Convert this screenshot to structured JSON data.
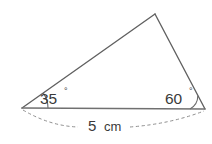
{
  "figure": {
    "kind": "triangle-geometry-diagram",
    "background_color": "#ffffff",
    "line_color": "#606060",
    "dash_color": "#8f8f8f",
    "text_color": "#3a3a3a",
    "vertices": {
      "left": {
        "x": 22,
        "y": 108
      },
      "right": {
        "x": 205,
        "y": 109
      },
      "apex": {
        "x": 155,
        "y": 14
      }
    },
    "angles": {
      "left": {
        "value": "35",
        "degree_symbol": "°",
        "label_x": 40,
        "label_y": 104,
        "deg_x": 64,
        "deg_y": 94,
        "arc_radius": 26
      },
      "right": {
        "value": "60",
        "degree_symbol": "°",
        "label_x": 165,
        "label_y": 104,
        "deg_x": 189,
        "deg_y": 94,
        "arc_radius": 15
      }
    },
    "dimension": {
      "value": "5",
      "unit": "cm",
      "label_x": 88,
      "label_y": 131,
      "unit_x": 104,
      "unit_y": 131,
      "arc_left_path": "M 23 110 Q 50 126 78 127",
      "arc_right_path": "M 130 127 Q 170 124 204 111"
    },
    "paths": {
      "left_to_apex": "M 22 108 L 155 14",
      "apex_to_right": "M 155 14 L 205 109",
      "base": "M 22 108 L 205 109",
      "left_angle_arc": "M 48 108 A 26 26 0 0 0 43.3 93.1",
      "right_angle_arc": "M 190 109 A 15 15 0 0 0 197.8 95.8"
    }
  }
}
